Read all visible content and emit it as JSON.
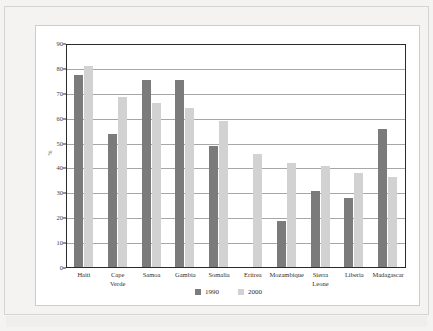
{
  "document": {
    "title_sliver": "",
    "y_axis_title": "%"
  },
  "chart_data": {
    "type": "bar",
    "title": "",
    "xlabel": "",
    "ylabel": "%",
    "ylim": [
      0,
      90
    ],
    "ytick_step": 10,
    "yticks": [
      0,
      10,
      20,
      30,
      40,
      50,
      60,
      70,
      80,
      90
    ],
    "ytick_labels": [
      "0",
      "10",
      "20",
      "30",
      "40",
      "50",
      "60",
      "70",
      "80",
      "90"
    ],
    "grid": true,
    "legend_position": "bottom-center",
    "categories": [
      "Haiti",
      "Cape\nVerde",
      "Samoa",
      "Gambia",
      "Somalia",
      "Eritrea",
      "Mozambique",
      "Sierra\nLeone",
      "Liberia",
      "Madagascar"
    ],
    "series": [
      {
        "name": "1990",
        "color": "#7b7b7b",
        "values": [
          78,
          54,
          76,
          76,
          49,
          null,
          18.5,
          31,
          28,
          56
        ]
      },
      {
        "name": "2000",
        "color": "#d2d2d2",
        "values": [
          81.5,
          69,
          66.5,
          64.5,
          59,
          46,
          42,
          41,
          38,
          36.5
        ]
      }
    ],
    "legend": [
      {
        "label": "1990",
        "color": "#7b7b7b"
      },
      {
        "label": "2000",
        "color": "#d2d2d2"
      }
    ]
  },
  "colors": {
    "page_background": "#f4f3f2",
    "panel_background": "#ffffff",
    "axis": "#2b2a29",
    "gridline": "#a9a7a5",
    "series_1990": "#7b7b7b",
    "series_2000": "#d2d2d2"
  }
}
